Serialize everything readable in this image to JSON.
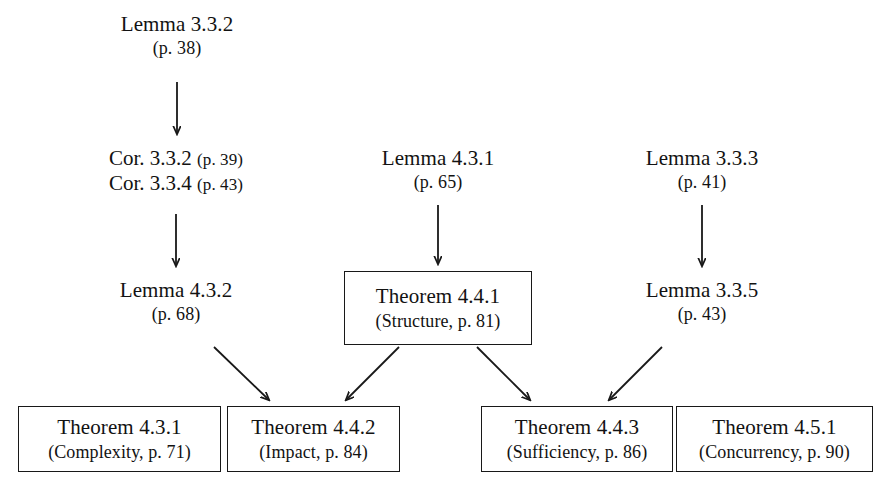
{
  "diagram": {
    "background_color": "#ffffff",
    "ink_color": "#181818",
    "nodes": {
      "lemma_332": {
        "line1": "Lemma 3.3.2",
        "line2": "(p. 38)"
      },
      "cor_stack": {
        "row1_label": "Cor. 3.3.2",
        "row1_page": "(p. 39)",
        "row2_label": "Cor. 3.3.4",
        "row2_page": "(p. 43)"
      },
      "lemma_431": {
        "line1": "Lemma 4.3.1",
        "line2": "(p. 65)"
      },
      "lemma_333": {
        "line1": "Lemma 3.3.3",
        "line2": "(p. 41)"
      },
      "lemma_432": {
        "line1": "Lemma 4.3.2",
        "line2": "(p. 68)"
      },
      "theorem_441": {
        "line1": "Theorem 4.4.1",
        "line2": "(Structure, p. 81)"
      },
      "lemma_335": {
        "line1": "Lemma 3.3.5",
        "line2": "(p. 43)"
      },
      "theorem_431": {
        "line1": "Theorem 4.3.1",
        "line2": "(Complexity, p. 71)"
      },
      "theorem_442": {
        "line1": "Theorem 4.4.2",
        "line2": "(Impact, p. 84)"
      },
      "theorem_443": {
        "line1": "Theorem 4.4.3",
        "line2": "(Sufficiency, p. 86)"
      },
      "theorem_451": {
        "line1": "Theorem 4.5.1",
        "line2": "(Concurrency, p. 90)"
      }
    },
    "edges": [
      {
        "from": "lemma_332",
        "to": "cor_stack",
        "kind": "vertical"
      },
      {
        "from": "cor_stack",
        "to": "lemma_432",
        "kind": "vertical"
      },
      {
        "from": "lemma_431",
        "to": "theorem_441",
        "kind": "vertical"
      },
      {
        "from": "lemma_333",
        "to": "lemma_335",
        "kind": "vertical"
      },
      {
        "from": "lemma_432",
        "to": "theorem_442",
        "kind": "diagonal-down-right"
      },
      {
        "from": "theorem_441",
        "to": "theorem_442",
        "kind": "diagonal-down-left"
      },
      {
        "from": "theorem_441",
        "to": "theorem_443",
        "kind": "diagonal-down-right"
      },
      {
        "from": "lemma_335",
        "to": "theorem_443",
        "kind": "diagonal-down-left"
      }
    ]
  }
}
